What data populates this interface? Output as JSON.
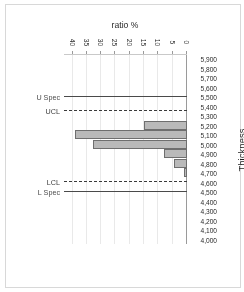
{
  "chart_data": {
    "type": "bar",
    "title": "",
    "orientation": "horizontal",
    "rotated_180": true,
    "xlabel": "ratio %",
    "ylabel": "Thickness",
    "categories": [
      "4,000",
      "4,100",
      "4,200",
      "4,300",
      "4,400",
      "4,500",
      "4,600",
      "4,700",
      "4,800",
      "4,900",
      "5,000",
      "5,100",
      "5,200",
      "5,300",
      "5,400",
      "5,500",
      "5,600",
      "5,700",
      "5,800",
      "5,900"
    ],
    "values": [
      0,
      0,
      0,
      0,
      0,
      0,
      0,
      1,
      4.5,
      8,
      33,
      39,
      15,
      0,
      0,
      0,
      0,
      0,
      0,
      0
    ],
    "xlim": [
      0,
      43
    ],
    "xticks": [
      0,
      5,
      10,
      15,
      20,
      25,
      30,
      35,
      40
    ],
    "xtick_labels": [
      "0",
      "5",
      "10",
      "15",
      "20",
      "25",
      "30",
      "35",
      "40"
    ],
    "grid": "vertical",
    "bar_fill": "#b9b9b9",
    "bar_edge": "#6e6e6e",
    "annotations": [
      {
        "name": "L Spec",
        "label": "L Spec",
        "value": 4500,
        "style": "solid",
        "color": "#4a4a4a"
      },
      {
        "name": "LCL",
        "label": "LCL",
        "value": 4600,
        "style": "dashed",
        "color": "#3a3a3a"
      },
      {
        "name": "UCL",
        "label": "UCL",
        "value": 5350,
        "style": "dashed",
        "color": "#3a3a3a"
      },
      {
        "name": "U Spec",
        "label": "U Spec",
        "value": 5500,
        "style": "solid",
        "color": "#4a4a4a"
      }
    ]
  }
}
